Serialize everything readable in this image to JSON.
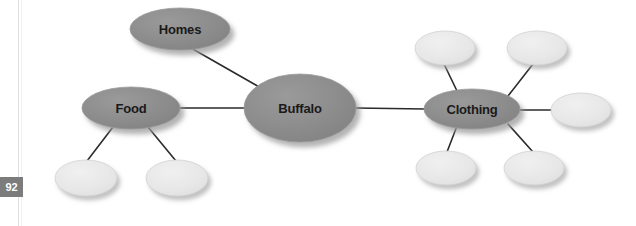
{
  "page": {
    "number": "92",
    "background_color": "#ffffff",
    "margin_rule_color": "#dcdcdc"
  },
  "diagram": {
    "type": "concept-map",
    "title": "Buffalo",
    "colors": {
      "major_node_fill": "#8a8a8a",
      "major_node_stroke": "#9a9a9a",
      "minor_node_fill": "#e8e8e8",
      "minor_node_stroke": "#d2d2d2",
      "connector": "#2b2b2b",
      "shadow": "#b4b4b4",
      "label_text": "#1a1a1a"
    },
    "nodes": [
      {
        "id": "buffalo",
        "label": "Buffalo",
        "kind": "center",
        "cx": 300,
        "cy": 108,
        "rx": 56,
        "ry": 34,
        "filled": true
      },
      {
        "id": "homes",
        "label": "Homes",
        "kind": "major",
        "cx": 180,
        "cy": 29,
        "rx": 50,
        "ry": 21,
        "filled": true
      },
      {
        "id": "food",
        "label": "Food",
        "kind": "major",
        "cx": 131,
        "cy": 108,
        "rx": 49,
        "ry": 21,
        "filled": true
      },
      {
        "id": "clothing",
        "label": "Clothing",
        "kind": "major",
        "cx": 472,
        "cy": 109,
        "rx": 48,
        "ry": 20,
        "filled": true
      },
      {
        "id": "food-child-1",
        "label": "",
        "kind": "minor",
        "cx": 86,
        "cy": 178,
        "rx": 31,
        "ry": 18,
        "filled": false
      },
      {
        "id": "food-child-2",
        "label": "",
        "kind": "minor",
        "cx": 177,
        "cy": 178,
        "rx": 31,
        "ry": 18,
        "filled": false
      },
      {
        "id": "clothing-child-1",
        "label": "",
        "kind": "minor",
        "cx": 445,
        "cy": 48,
        "rx": 30,
        "ry": 17,
        "filled": false
      },
      {
        "id": "clothing-child-2",
        "label": "",
        "kind": "minor",
        "cx": 537,
        "cy": 48,
        "rx": 30,
        "ry": 17,
        "filled": false
      },
      {
        "id": "clothing-child-3",
        "label": "",
        "kind": "minor",
        "cx": 581,
        "cy": 110,
        "rx": 30,
        "ry": 17,
        "filled": false
      },
      {
        "id": "clothing-child-4",
        "label": "",
        "kind": "minor",
        "cx": 446,
        "cy": 168,
        "rx": 30,
        "ry": 17,
        "filled": false
      },
      {
        "id": "clothing-child-5",
        "label": "",
        "kind": "minor",
        "cx": 534,
        "cy": 168,
        "rx": 30,
        "ry": 17,
        "filled": false
      }
    ],
    "edges": [
      {
        "id": "edge-homes-buffalo",
        "from": "homes",
        "to": "buffalo",
        "x1": 191,
        "y1": 48,
        "x2": 268,
        "y2": 92
      },
      {
        "id": "edge-food-buffalo",
        "from": "food",
        "to": "buffalo",
        "x1": 180,
        "y1": 108,
        "x2": 245,
        "y2": 108
      },
      {
        "id": "edge-buffalo-clothing",
        "from": "buffalo",
        "to": "clothing",
        "x1": 356,
        "y1": 108,
        "x2": 425,
        "y2": 109
      },
      {
        "id": "edge-food-c1",
        "from": "food",
        "to": "food-child-1",
        "x1": 113,
        "y1": 127,
        "x2": 87,
        "y2": 161
      },
      {
        "id": "edge-food-c2",
        "from": "food",
        "to": "food-child-2",
        "x1": 148,
        "y1": 127,
        "x2": 176,
        "y2": 161
      },
      {
        "id": "edge-clothing-c1",
        "from": "clothing",
        "to": "clothing-child-1",
        "x1": 458,
        "y1": 93,
        "x2": 444,
        "y2": 64
      },
      {
        "id": "edge-clothing-c2",
        "from": "clothing",
        "to": "clothing-child-2",
        "x1": 508,
        "y1": 96,
        "x2": 533,
        "y2": 64
      },
      {
        "id": "edge-clothing-c3",
        "from": "clothing",
        "to": "clothing-child-3",
        "x1": 520,
        "y1": 110,
        "x2": 552,
        "y2": 110
      },
      {
        "id": "edge-clothing-c4",
        "from": "clothing",
        "to": "clothing-child-4",
        "x1": 457,
        "y1": 126,
        "x2": 447,
        "y2": 152
      },
      {
        "id": "edge-clothing-c5",
        "from": "clothing",
        "to": "clothing-child-5",
        "x1": 508,
        "y1": 124,
        "x2": 533,
        "y2": 152
      }
    ]
  }
}
